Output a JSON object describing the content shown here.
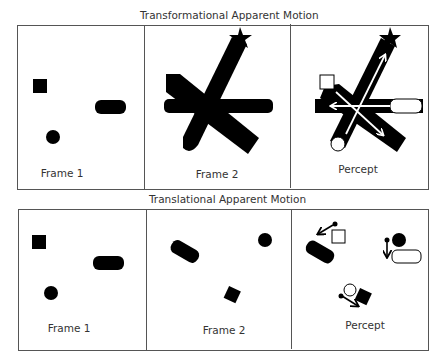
{
  "top": {
    "title": "Transformational Apparent Motion",
    "panels": [
      {
        "label": "Frame 1"
      },
      {
        "label": "Frame 2"
      },
      {
        "label": "Percept"
      }
    ]
  },
  "bottom": {
    "title": "Translational Apparent Motion",
    "panels": [
      {
        "label": "Frame 1"
      },
      {
        "label": "Frame 2"
      },
      {
        "label": "Percept"
      }
    ]
  },
  "colors": {
    "shape_fill": "#000000",
    "border": "#555555",
    "background": "#ffffff"
  }
}
